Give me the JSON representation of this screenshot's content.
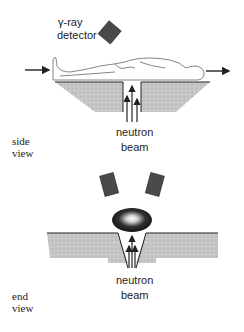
{
  "figure": {
    "side_view": {
      "label_line1": "side",
      "label_line2": "view",
      "detector_label_line1": "γ-ray",
      "detector_label_line2": "detector",
      "beam_label_line1": "neutron",
      "beam_label_line2": "beam"
    },
    "end_view": {
      "label_line1": "end",
      "label_line2": "view",
      "beam_label_line1": "neutron",
      "beam_label_line2": "beam"
    },
    "colors": {
      "detector": "#4a4a4a",
      "slab_fill": "#c4c4c4",
      "line": "#222222",
      "ellipse_dark": "#1a1a1a",
      "ellipse_glow": "#ffffff"
    }
  }
}
